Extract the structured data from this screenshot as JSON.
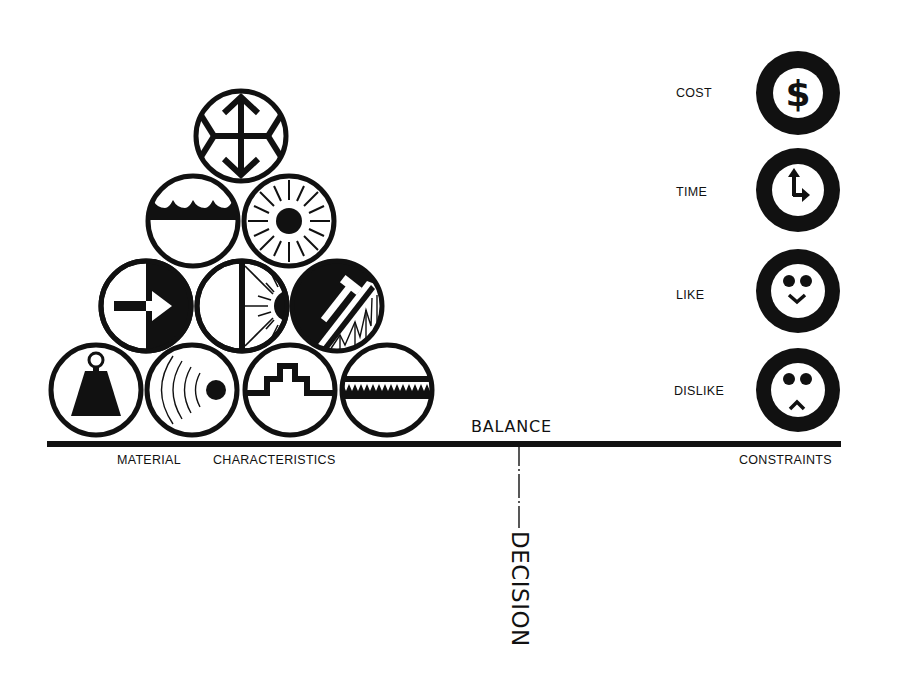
{
  "diagram": {
    "colors": {
      "ink": "#111111",
      "background": "#ffffff"
    },
    "beam_label": "BALANCE",
    "output_label": "DECISION",
    "left_group": {
      "label_part1": "MATERIAL",
      "label_part2": "CHARACTERISTICS",
      "pyramid": [
        {
          "row": 1,
          "icons": [
            "expansion-arrows-icon"
          ]
        },
        {
          "row": 2,
          "icons": [
            "water-waves-icon",
            "sun-heat-icon"
          ]
        },
        {
          "row": 3,
          "icons": [
            "arrow-penetration-icon",
            "light-reflection-icon",
            "hammer-structure-icon"
          ]
        },
        {
          "row": 4,
          "icons": [
            "weight-icon",
            "sound-waves-icon",
            "stepped-profile-icon",
            "serrated-texture-icon"
          ]
        }
      ]
    },
    "right_group": {
      "label": "CONSTRAINTS",
      "items": [
        {
          "label": "COST",
          "icon": "dollar-icon"
        },
        {
          "label": "TIME",
          "icon": "clock-icon"
        },
        {
          "label": "LIKE",
          "icon": "happy-face-icon"
        },
        {
          "label": "DISLIKE",
          "icon": "sad-face-icon"
        }
      ]
    }
  }
}
